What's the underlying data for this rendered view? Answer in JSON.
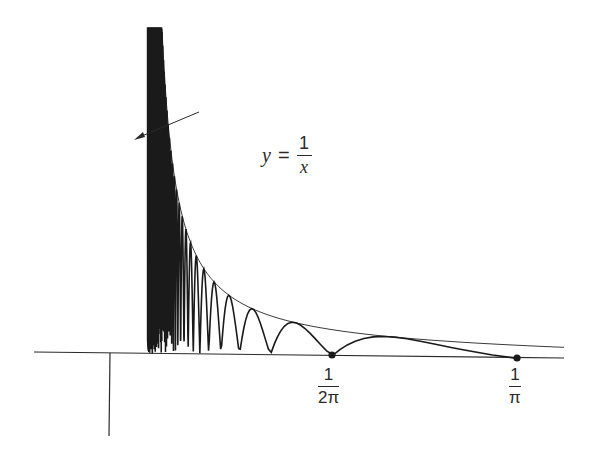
{
  "figure": {
    "type": "function-plot",
    "colors": {
      "curve": "#1a1a1a",
      "envelope": "#3a3a3a",
      "axes": "#2a2a2a",
      "background": "#ffffff"
    }
  },
  "annotation": {
    "lhs": "y",
    "equals": "=",
    "numerator": "1",
    "denominator": "x",
    "text": "y = 1/x"
  },
  "ticks": [
    {
      "id": "one-over-two-pi",
      "numerator": "1",
      "denominator": "2π",
      "value": 0.15915
    },
    {
      "id": "one-over-pi",
      "numerator": "1",
      "denominator": "π",
      "value": 0.31831
    }
  ],
  "chart_data": {
    "type": "line",
    "title": "",
    "xlabel": "",
    "ylabel": "",
    "series": [
      {
        "name": "y = 1/x (envelope)",
        "formula": "1/x"
      },
      {
        "name": "oscillating curve",
        "formula": "|sin(1/x)| / x",
        "zeros": [
          "1/(2π)",
          "1/π"
        ]
      }
    ],
    "annotations": [
      "y = 1/x"
    ],
    "x_tick_labels": [
      "1/2π",
      "1/π"
    ],
    "marked_points": [
      {
        "x": "1/(2π)",
        "y": 0
      },
      {
        "x": "1/π",
        "y": 0
      }
    ],
    "grid": false,
    "legend": "none"
  }
}
